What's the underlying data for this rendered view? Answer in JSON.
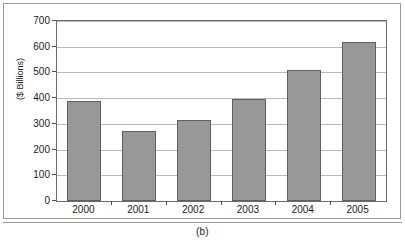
{
  "figure": {
    "caption": "(b)"
  },
  "chart_data": {
    "type": "bar",
    "title": "",
    "xlabel": "",
    "ylabel": "($ Billions)",
    "categories": [
      "2000",
      "2001",
      "2002",
      "2003",
      "2004",
      "2005"
    ],
    "values": [
      389,
      274,
      316,
      396,
      508,
      620
    ],
    "ylim": [
      0,
      700
    ],
    "yticks": [
      0,
      100,
      200,
      300,
      400,
      500,
      600,
      700
    ],
    "ytick_labels": [
      "0",
      "100",
      "200",
      "300",
      "400",
      "500",
      "600",
      "700"
    ],
    "grid": true,
    "legend": null,
    "bar_color": "#989898",
    "bar_border_color": "#606060",
    "gridline_color": "#b9b9b9",
    "axis_color": "#6b6b6b"
  }
}
